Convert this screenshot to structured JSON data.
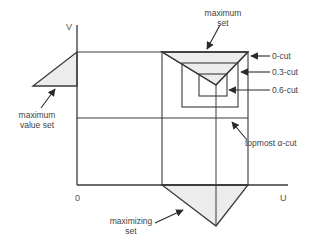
{
  "diagram": {
    "axes": {
      "v_label": "V",
      "u_label": "U",
      "origin_label": "0"
    },
    "labels": {
      "maximum_set_line1": "maximum",
      "maximum_set_line2": "set",
      "maximum_value_set_line1": "maximum",
      "maximum_value_set_line2": "value set",
      "maximizing_set_line1": "maximizing",
      "maximizing_set_line2": "set",
      "cut_0": "0-cut",
      "cut_03": "0.3-cut",
      "cut_06": "0.6-cut",
      "topmost_cut": "topmost α-cut"
    },
    "colors": {
      "line": "#3a3a3a",
      "fill": "#ececec",
      "text": "#444444"
    }
  }
}
